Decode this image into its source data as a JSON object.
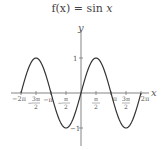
{
  "chart_data": {
    "type": "line",
    "title": "f(x) = sin x",
    "xlabel": "x",
    "ylabel": "y",
    "xlim": [
      -6.2832,
      6.2832
    ],
    "ylim": [
      -1,
      1
    ],
    "grid": false,
    "legend": null,
    "x_ticks": [
      "-2π",
      "-3π/2",
      "-π",
      "-π/2",
      "π/2",
      "π",
      "3π/2",
      "2π"
    ],
    "y_ticks": [
      "1",
      "-1"
    ],
    "series": [
      {
        "name": "sin x",
        "function": "sin(x)",
        "x": [
          -6.2832,
          -4.7124,
          -3.1416,
          -1.5708,
          0,
          1.5708,
          3.1416,
          4.7124,
          6.2832
        ],
        "values": [
          0,
          1,
          0,
          -1,
          0,
          1,
          0,
          -1,
          0
        ]
      }
    ]
  },
  "labels": {
    "title_prefix": "f(x) = sin ",
    "title_var": "x",
    "x_axis": "x",
    "y_axis": "y",
    "y_tick_pos": "1",
    "y_tick_neg": "−1"
  }
}
